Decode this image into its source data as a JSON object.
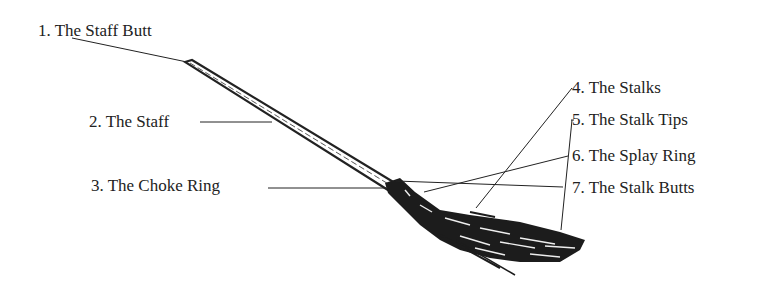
{
  "diagram": {
    "labels": [
      {
        "id": 1,
        "text": "1. The Staff Butt"
      },
      {
        "id": 2,
        "text": "2. The Staff"
      },
      {
        "id": 3,
        "text": "3. The Choke Ring"
      },
      {
        "id": 4,
        "text": "4. The Stalks"
      },
      {
        "id": 5,
        "text": "5. The Stalk Tips"
      },
      {
        "id": 6,
        "text": "6. The Splay Ring"
      },
      {
        "id": 7,
        "text": "7. The Stalk Butts"
      }
    ],
    "colors": {
      "ink": "#222222",
      "background": "#ffffff"
    }
  }
}
